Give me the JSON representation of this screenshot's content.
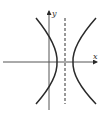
{
  "diagram": {
    "type": "hyperbola-graph",
    "axes": {
      "x_label": "x",
      "y_label": "y"
    },
    "asymptote_style": "dashed-vertical-line",
    "colors": {
      "stroke": "#2a2a2a",
      "background": "#ffffff"
    }
  }
}
